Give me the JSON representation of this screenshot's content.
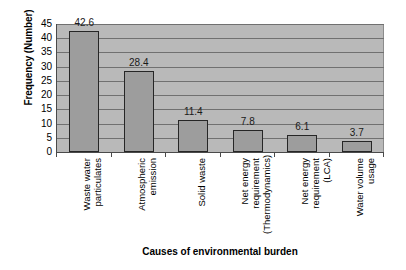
{
  "chart_data": {
    "type": "bar",
    "title": "",
    "xlabel": "Causes of environmental burden",
    "ylabel": "Frequency (Number)",
    "categories": [
      "Waste water particulates",
      "Atmospheric emission",
      "Solid waste",
      "Net energy requirement (Thermodynamics)",
      "Net energy requirement (LCA)",
      "Water volume usage"
    ],
    "category_lines": [
      [
        "Waste water",
        "particulates"
      ],
      [
        "Atmospheric",
        "emission"
      ],
      [
        "Solid waste"
      ],
      [
        "Net energy",
        "requirement",
        "(Thermodynamics)"
      ],
      [
        "Net energy",
        "requirement (LCA)"
      ],
      [
        "Water volume",
        "usage"
      ]
    ],
    "values": [
      42.6,
      28.4,
      11.4,
      7.8,
      6.1,
      3.7
    ],
    "value_labels": [
      "42.6",
      "28.4",
      "11.4",
      "7.8",
      "6.1",
      "3.7"
    ],
    "ylim": [
      0,
      45
    ],
    "yticks": [
      0,
      5,
      10,
      15,
      20,
      25,
      30,
      35,
      40,
      45
    ],
    "ytick_labels": [
      "0",
      "5",
      "10",
      "15",
      "20",
      "25",
      "30",
      "35",
      "40",
      "45"
    ],
    "grid": true,
    "grid_axis": "y",
    "legend": false,
    "legend_position": "none",
    "colors": {
      "bar_fill": "#9d9d9d",
      "bar_border": "#262626",
      "plot_background": "#b9b9b9",
      "gridline": "#707070",
      "axis": "#4a4a4a",
      "text": "#000000",
      "page_background": "#ffffff"
    }
  }
}
